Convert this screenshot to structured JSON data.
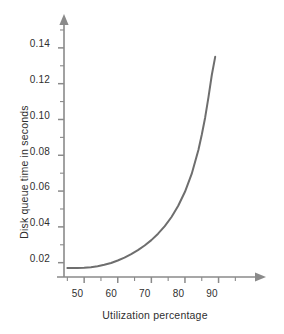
{
  "chart_data": {
    "type": "line",
    "title": "",
    "subtitle": "",
    "xlabel": "Utilization percentage",
    "ylabel": "Disk queue time in seconds",
    "xlim": [
      44,
      100
    ],
    "ylim": [
      0.012,
      0.152
    ],
    "xticks": [
      50,
      60,
      70,
      80,
      90
    ],
    "xtick_labels": [
      "50",
      "60",
      "70",
      "80",
      "90"
    ],
    "xminor_step": 5,
    "yticks": [
      0.02,
      0.04,
      0.06,
      0.08,
      0.1,
      0.12,
      0.14
    ],
    "ytick_labels": [
      "0.02",
      "0.04",
      "0.06",
      "0.08",
      "0.10",
      "0.12",
      "0.14"
    ],
    "yminor_step": 0.01,
    "grid": false,
    "legend": null,
    "legend_position": "none",
    "annotations": [],
    "axis_arrows": {
      "x": "right",
      "y": "up"
    },
    "series": [
      {
        "name": "Disk queue time",
        "color": "#6e6e6e",
        "line_width": 2,
        "x": [
          45,
          48,
          50,
          52,
          54,
          56,
          58,
          60,
          62,
          64,
          66,
          68,
          70,
          72,
          74,
          76,
          78,
          80,
          82,
          84,
          85,
          86,
          87,
          88,
          89
        ],
        "y": [
          0.017,
          0.017,
          0.0172,
          0.0175,
          0.018,
          0.0188,
          0.0198,
          0.0212,
          0.0228,
          0.0248,
          0.027,
          0.0296,
          0.0326,
          0.0362,
          0.0404,
          0.0455,
          0.0518,
          0.0596,
          0.0696,
          0.083,
          0.0915,
          0.101,
          0.1125,
          0.125,
          0.135
        ]
      }
    ]
  },
  "axes": {
    "axis_color": "#8a8a8a",
    "tick_color": "#8a8a8a",
    "text_color": "#2f2f2f"
  },
  "tick_labels": {
    "y": [
      "0.14",
      "0.12",
      "0.10",
      "0.08",
      "0.06",
      "0.04",
      "0.02"
    ],
    "x": [
      "50",
      "60",
      "70",
      "80",
      "90"
    ]
  }
}
